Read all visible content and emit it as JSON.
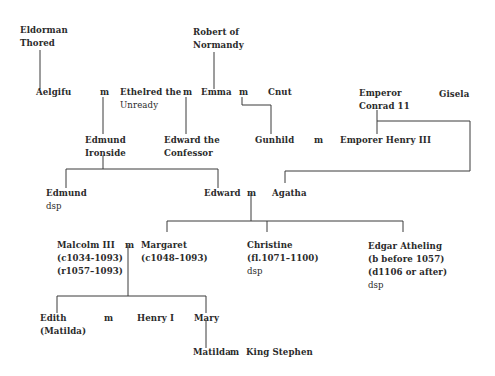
{
  "marriage_symbol": "m",
  "people": {
    "thored": [
      "Eldorman",
      "Thored"
    ],
    "robert": [
      "Robert of",
      "Normandy"
    ],
    "aelgifu": [
      "Aelgifu"
    ],
    "ethelred": [
      "Ethelred the",
      "Unready"
    ],
    "emma": [
      "Emma"
    ],
    "cnut": [
      "Cnut"
    ],
    "conrad": [
      "Emperor",
      "Conrad 11"
    ],
    "gisela": [
      "Gisela"
    ],
    "edmund_ironside": [
      "Edmund",
      "Ironside"
    ],
    "edward_confessor": [
      "Edward the",
      "Confessor"
    ],
    "gunhild": [
      "Gunhild"
    ],
    "henry3": [
      "Emporer Henry III"
    ],
    "edmund_dsp": [
      "Edmund",
      "dsp"
    ],
    "edward": [
      "Edward"
    ],
    "agatha": [
      "Agatha"
    ],
    "malcolm": [
      "Malcolm III",
      "(c1034-1093)",
      "(r1057–1093)"
    ],
    "margaret": [
      "Margaret",
      "(c1048–1093)"
    ],
    "christine": [
      "Christine",
      "(fl.1071–1100)",
      "dsp"
    ],
    "edgar": [
      "Edgar Atheling",
      "(b before 1057)",
      "(d1106 or after)",
      "dsp"
    ],
    "edith": [
      "Edith",
      "(Matilda)"
    ],
    "henry1": [
      "Henry I"
    ],
    "mary": [
      "Mary"
    ],
    "matilda": [
      "Matilda"
    ],
    "stephen": [
      "King Stephen"
    ]
  },
  "marriages": [
    {
      "a": "Aelgifu",
      "b": "Ethelred the Unready"
    },
    {
      "a": "Ethelred the Unready",
      "b": "Emma"
    },
    {
      "a": "Emma",
      "b": "Cnut"
    },
    {
      "a": "Gunhild",
      "b": "Emporer Henry III"
    },
    {
      "a": "Edward",
      "b": "Agatha"
    },
    {
      "a": "Malcolm III",
      "b": "Margaret"
    },
    {
      "a": "Edith (Matilda)",
      "b": "Henry I"
    },
    {
      "a": "Matilda",
      "b": "King Stephen"
    }
  ]
}
